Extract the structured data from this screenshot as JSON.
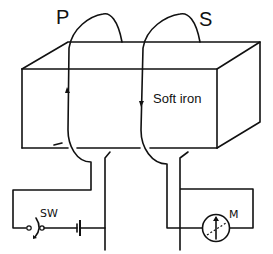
{
  "diagram": {
    "labels": {
      "primary": "P",
      "secondary": "S",
      "core": "Soft iron",
      "switch": "SW",
      "meter": "M"
    },
    "components": [
      {
        "id": "core",
        "type": "soft-iron-block"
      },
      {
        "id": "primary-coil",
        "type": "coil",
        "current_arrow": "up"
      },
      {
        "id": "secondary-coil",
        "type": "coil",
        "current_arrow": "down"
      },
      {
        "id": "switch",
        "type": "switch",
        "label": "SW"
      },
      {
        "id": "battery",
        "type": "cell"
      },
      {
        "id": "meter",
        "type": "galvanometer",
        "label": "M"
      }
    ],
    "colors": {
      "line": "#111111",
      "background": "#ffffff"
    }
  }
}
